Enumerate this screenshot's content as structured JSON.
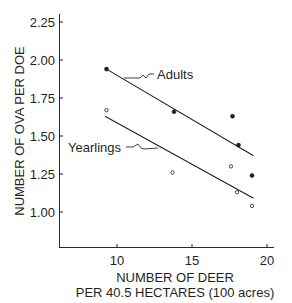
{
  "chart_data": {
    "type": "scatter",
    "title": "",
    "xlabel": "NUMBER OF DEER\nPER 40.5 HECTARES (100 acres)",
    "xlabel_line1": "NUMBER OF DEER",
    "xlabel_line2": "PER 40.5 HECTARES (100 acres)",
    "ylabel": "NUMBER OF OVA PER DOE",
    "xlim": [
      6.2,
      20.4
    ],
    "ylim": [
      0.82,
      2.29
    ],
    "xticks": [
      10,
      15,
      20
    ],
    "xtick_labels": [
      "10",
      "15",
      "20"
    ],
    "yticks": [
      1.0,
      1.25,
      1.5,
      1.75,
      2.0,
      2.25
    ],
    "ytick_labels": [
      "1.00",
      "1.25",
      "1.50",
      "1.75",
      "2.00",
      "2.25"
    ],
    "grid": false,
    "legend": "inline annotations",
    "series": [
      {
        "name": "Adults",
        "marker": "filled circle",
        "points": [
          {
            "x": 9.3,
            "y": 1.94
          },
          {
            "x": 13.8,
            "y": 1.66
          },
          {
            "x": 17.7,
            "y": 1.63
          },
          {
            "x": 18.1,
            "y": 1.44
          },
          {
            "x": 19.0,
            "y": 1.24
          }
        ],
        "fit_line": [
          {
            "x": 9.3,
            "y": 1.94
          },
          {
            "x": 19.1,
            "y": 1.37
          }
        ]
      },
      {
        "name": "Yearlings",
        "marker": "open circle",
        "points": [
          {
            "x": 9.3,
            "y": 1.67
          },
          {
            "x": 13.7,
            "y": 1.26
          },
          {
            "x": 17.6,
            "y": 1.3
          },
          {
            "x": 18.0,
            "y": 1.13
          },
          {
            "x": 19.0,
            "y": 1.04
          }
        ],
        "fit_line": [
          {
            "x": 9.2,
            "y": 1.63
          },
          {
            "x": 19.1,
            "y": 1.09
          }
        ]
      }
    ],
    "annotations": [
      {
        "text": "Adults",
        "points_to": "Adults fit line"
      },
      {
        "text": "Yearlings",
        "points_to": "Yearlings fit line"
      }
    ]
  },
  "labels": {
    "adults": "Adults",
    "yearlings": "Yearlings"
  },
  "colors": {
    "ink": "#1f1f1f",
    "background": "#ffffff"
  }
}
